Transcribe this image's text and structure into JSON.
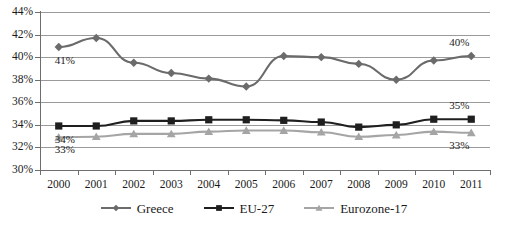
{
  "chart_data": {
    "type": "line",
    "title": "",
    "xlabel": "",
    "ylabel": "",
    "categories": [
      "2000",
      "2001",
      "2002",
      "2003",
      "2004",
      "2005",
      "2006",
      "2007",
      "2008",
      "2009",
      "2010",
      "2011"
    ],
    "ylim": [
      30,
      44
    ],
    "ytick_labels": [
      "30%",
      "32%",
      "34%",
      "36%",
      "38%",
      "40%",
      "42%",
      "44%"
    ],
    "ytick_values": [
      30,
      32,
      34,
      36,
      38,
      40,
      42,
      44
    ],
    "grid": true,
    "legend_position": "bottom",
    "series": [
      {
        "name": "Greece",
        "marker": "diamond",
        "color": "#6b6b6b",
        "values": [
          40.9,
          41.7,
          39.5,
          38.6,
          38.1,
          37.4,
          40.1,
          40.0,
          39.4,
          38.0,
          39.7,
          40.1
        ]
      },
      {
        "name": "EU-27",
        "marker": "square",
        "color": "#1f1f1f",
        "values": [
          33.9,
          33.9,
          34.35,
          34.35,
          34.45,
          34.45,
          34.4,
          34.25,
          33.8,
          34.0,
          34.5,
          34.5
        ]
      },
      {
        "name": "Eurozone-17",
        "marker": "triangle",
        "color": "#a5a5a5",
        "values": [
          32.9,
          32.95,
          33.2,
          33.2,
          33.4,
          33.5,
          33.5,
          33.35,
          32.95,
          33.1,
          33.4,
          33.3
        ]
      }
    ],
    "annotations": [
      {
        "text": "41%",
        "series": "Greece",
        "at": "2000",
        "side": "left"
      },
      {
        "text": "40%",
        "series": "Greece",
        "at": "2011",
        "side": "right"
      },
      {
        "text": "34%",
        "series": "EU-27",
        "at": "2000",
        "side": "left"
      },
      {
        "text": "35%",
        "series": "EU-27",
        "at": "2011",
        "side": "right"
      },
      {
        "text": "33%",
        "series": "Eurozone-17",
        "at": "2000",
        "side": "left"
      },
      {
        "text": "33%",
        "series": "Eurozone-17",
        "at": "2011",
        "side": "right"
      }
    ]
  },
  "legend": {
    "items": [
      {
        "label": "Greece",
        "color": "#6b6b6b",
        "marker": "diamond"
      },
      {
        "label": "EU-27",
        "color": "#1f1f1f",
        "marker": "square"
      },
      {
        "label": "Eurozone-17",
        "color": "#a5a5a5",
        "marker": "triangle"
      }
    ]
  },
  "footer": {
    "cropped_caption": ""
  }
}
